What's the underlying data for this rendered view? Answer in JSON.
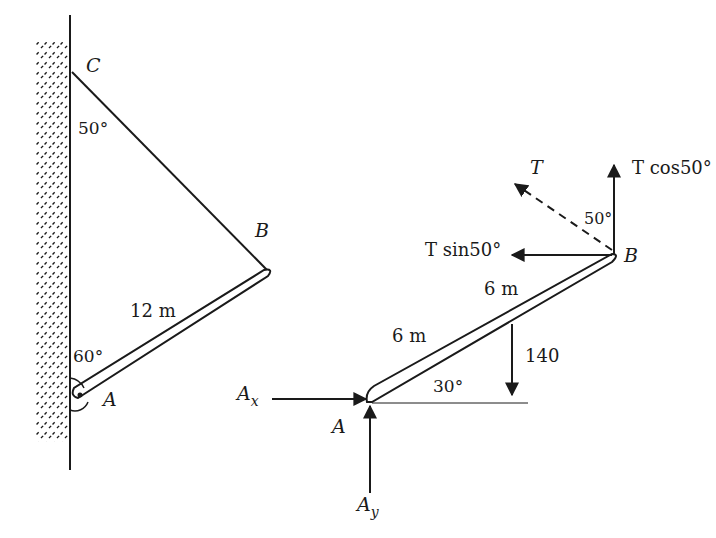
{
  "left_figure": {
    "labels": {
      "point_c": "C",
      "point_b": "B",
      "point_a": "A",
      "angle_at_c": "50°",
      "angle_at_a": "60°",
      "beam_length": "12 m"
    }
  },
  "right_figure": {
    "labels": {
      "tension": "T",
      "tension_vertical": "T cos50°",
      "tension_horizontal": "T sin50°",
      "angle_at_b": "50°",
      "point_b": "B",
      "point_a": "A",
      "upper_segment": "6 m",
      "lower_segment": "6 m",
      "load": "140",
      "beam_angle": "30°",
      "reaction_x": "A",
      "reaction_x_sub": "x",
      "reaction_y": "A",
      "reaction_y_sub": "y"
    }
  },
  "colors": {
    "ink": "#1a1a1a",
    "background": "#ffffff"
  }
}
